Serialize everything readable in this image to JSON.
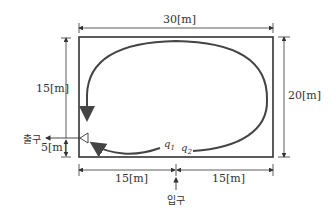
{
  "diagram": {
    "type": "tank flow path (plan view)",
    "dimensions": {
      "width_total": "30[m]",
      "height_total": "20[m]",
      "left_upper": "15[m]",
      "left_lower": "5[m]",
      "bottom_left": "15[m]",
      "bottom_right": "15[m]"
    },
    "labels": {
      "exit": "출구",
      "entrance": "입구",
      "q1": "q",
      "q1_sub": "1",
      "q2": "q",
      "q2_sub": "2"
    },
    "colors": {
      "line": "#333333",
      "flow": "#444444",
      "background": "#ffffff"
    }
  }
}
